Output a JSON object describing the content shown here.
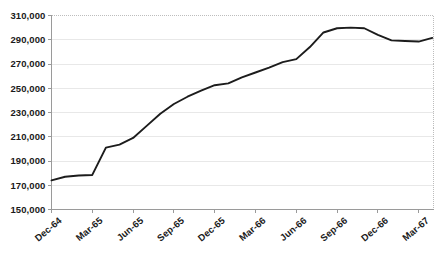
{
  "chart_data": {
    "type": "line",
    "title": "",
    "subtitle": "",
    "xlabel": "",
    "ylabel": "",
    "ylim": [
      150000,
      310000
    ],
    "ytick_step": 20000,
    "ytick_labels": [
      "150,000",
      "170,000",
      "190,000",
      "210,000",
      "230,000",
      "250,000",
      "270,000",
      "290,000",
      "310,000"
    ],
    "ytick_values": [
      150000,
      170000,
      190000,
      210000,
      230000,
      250000,
      270000,
      290000,
      310000
    ],
    "xtick_labels": [
      "Dec-64",
      "Mar-65",
      "Jun-65",
      "Sep-65",
      "Dec-65",
      "Mar-66",
      "Jun-66",
      "Sep-66",
      "Dec-66",
      "Mar-67"
    ],
    "xtick_index": [
      0,
      3,
      6,
      9,
      12,
      15,
      18,
      21,
      24,
      27
    ],
    "grid": true,
    "grid_axis": "y",
    "legend": false,
    "legend_position": "none",
    "series_name": "",
    "series_color": "#1c1c1c",
    "x": [
      "Dec-64",
      "Jan-65",
      "Feb-65",
      "Mar-65",
      "Apr-65",
      "May-65",
      "Jun-65",
      "Jul-65",
      "Aug-65",
      "Sep-65",
      "Oct-65",
      "Nov-65",
      "Dec-65",
      "Jan-66",
      "Feb-66",
      "Mar-66",
      "Apr-66",
      "May-66",
      "Jun-66",
      "Jul-66",
      "Aug-66",
      "Sep-66",
      "Oct-66",
      "Nov-66",
      "Dec-66",
      "Jan-67",
      "Feb-67",
      "Mar-67",
      "Apr-67"
    ],
    "values": [
      174000,
      177000,
      178000,
      178500,
      201000,
      203500,
      209000,
      219000,
      229000,
      237000,
      243000,
      248000,
      252500,
      254000,
      259000,
      263000,
      267000,
      271500,
      274000,
      284000,
      296000,
      299500,
      300000,
      299500,
      294000,
      289500,
      289000,
      288500,
      291500
    ]
  }
}
